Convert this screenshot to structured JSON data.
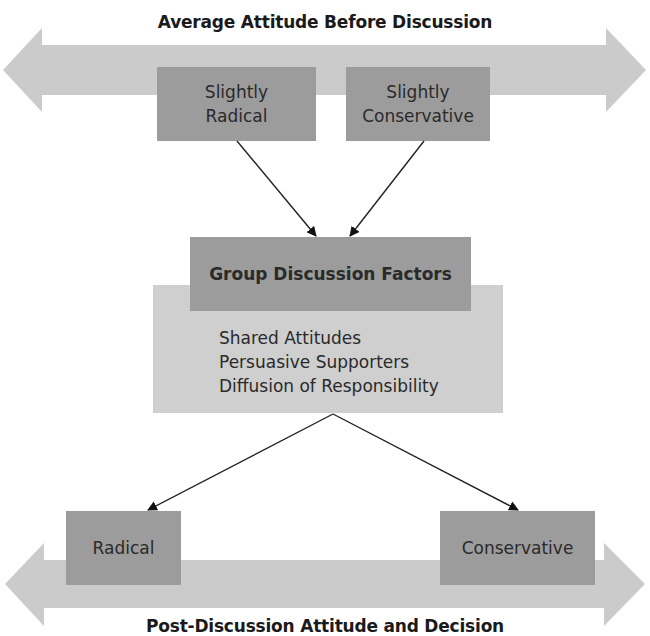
{
  "diagram": {
    "top_band": {
      "label": "Average Attitude Before Discussion",
      "color": "#cbcbcb"
    },
    "initial_attitudes": [
      {
        "line1": "Slightly",
        "line2": "Radical"
      },
      {
        "line1": "Slightly",
        "line2": "Conservative"
      }
    ],
    "discussion": {
      "header": "Group Discussion Factors",
      "factors": [
        "Shared Attitudes",
        "Persuasive Supporters",
        "Diffusion of Responsibility"
      ],
      "header_color": "#9c9c9c",
      "body_color": "#cfcfcf"
    },
    "outcomes": [
      {
        "label": "Radical"
      },
      {
        "label": "Conservative"
      }
    ],
    "bottom_band": {
      "label": "Post-Discussion Attitude and Decision",
      "color": "#cbcbcb"
    }
  }
}
